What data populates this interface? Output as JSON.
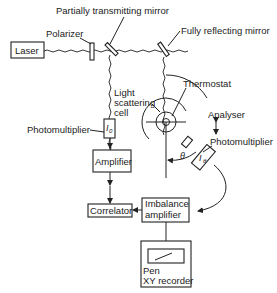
{
  "diagram": {
    "components": {
      "laser": "Laser",
      "polarizer": "Polarizer",
      "partial_mirror": "Partially transmitting mirror",
      "full_mirror": "Fully reflecting mirror",
      "cell_line1": "Light",
      "cell_line2": "scattering",
      "cell_line3": "cell",
      "thermostat": "Thermostat",
      "analyser": "Analyser",
      "pm_left": "Photomultiplier",
      "pm_left_symbol": "I",
      "pm_left_sub": "0",
      "pm_right": "Photomultiplier",
      "pm_right_symbol": "I",
      "pm_right_sub": "θ",
      "theta": "θ",
      "amplifier": "Amplifier",
      "correlator": "Correlator",
      "imbalance_line1": "Imbalance",
      "imbalance_line2": "amplifier",
      "recorder_line1": "Pen",
      "recorder_line2": "XY recorder"
    }
  }
}
